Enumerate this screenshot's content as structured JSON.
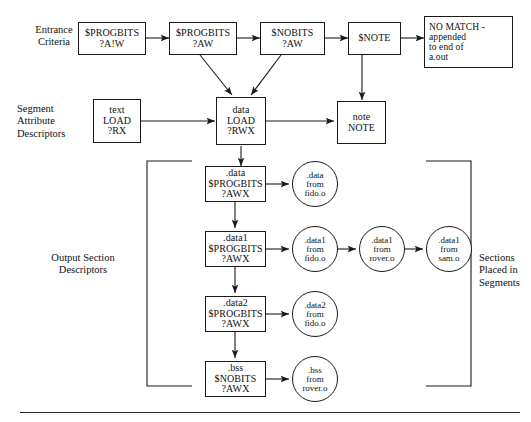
{
  "diagram": {
    "row_labels": {
      "entrance_criteria": [
        "Entrance",
        "Criteria"
      ],
      "segment_attribute_descriptors": [
        "Segment",
        "Attribute",
        "Descriptors"
      ],
      "output_section_descriptors": [
        "Output Section",
        "Descriptors"
      ],
      "sections_placed_in_segments": [
        "Sections",
        "Placed in",
        "Segments"
      ]
    },
    "entrance_criteria_nodes": [
      {
        "id": "ec-progbits-anw",
        "lines": [
          "$PROGBITS",
          "?A!W"
        ]
      },
      {
        "id": "ec-progbits-aw",
        "lines": [
          "$PROGBITS",
          "?AW"
        ]
      },
      {
        "id": "ec-nobits-aw",
        "lines": [
          "$NOBITS",
          "?AW"
        ]
      },
      {
        "id": "ec-note",
        "lines": [
          "$NOTE"
        ]
      },
      {
        "id": "ec-no-match",
        "lines": [
          "NO MATCH -",
          "appended",
          "to end of",
          "a.out"
        ]
      }
    ],
    "segment_nodes": [
      {
        "id": "seg-text",
        "lines": [
          "text",
          "LOAD",
          "?RX"
        ]
      },
      {
        "id": "seg-data",
        "lines": [
          "data",
          "LOAD",
          "?RWX"
        ]
      },
      {
        "id": "seg-note",
        "lines": [
          "note",
          "NOTE"
        ]
      }
    ],
    "output_section_nodes": [
      {
        "id": "osd-data",
        "lines": [
          ".data",
          "$PROGBITS",
          "?AWX"
        ]
      },
      {
        "id": "osd-data1",
        "lines": [
          ".data1",
          "$PROGBITS",
          "?AWX"
        ]
      },
      {
        "id": "osd-data2",
        "lines": [
          ".data2",
          "$PROGBITS",
          "?AWX"
        ]
      },
      {
        "id": "osd-bss",
        "lines": [
          ".bss",
          "$NOBITS",
          "?AWX"
        ]
      }
    ],
    "section_circles": [
      {
        "id": "sec-data-fido",
        "lines": [
          ".data",
          "from",
          "fido.o"
        ]
      },
      {
        "id": "sec-data1-fido",
        "lines": [
          ".data1",
          "from",
          "fido.o"
        ]
      },
      {
        "id": "sec-data1-rover",
        "lines": [
          ".data1",
          "from",
          "rover.o"
        ]
      },
      {
        "id": "sec-data1-sam",
        "lines": [
          ".data1",
          "from",
          "sam.o"
        ]
      },
      {
        "id": "sec-data2-fido",
        "lines": [
          ".data2",
          "from",
          "fido.o"
        ]
      },
      {
        "id": "sec-bss-rover",
        "lines": [
          ".bss",
          "from",
          "rover.o"
        ]
      }
    ],
    "colors": {
      "stroke": "#1a1a1a",
      "background": "#ffffff",
      "rule": "#2b2b2b"
    }
  }
}
